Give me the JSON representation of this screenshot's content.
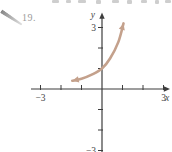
{
  "problem": {
    "number": "19."
  },
  "figure": {
    "background": "#ffffff",
    "axis_color": "#3d3d3d",
    "label_color": "#454545",
    "number_color": "#9b9b9b",
    "pencil_color": "#868686"
  },
  "chart_data": {
    "type": "line",
    "title": "",
    "xlabel": "x",
    "ylabel": "y",
    "xlim": [
      -3,
      3
    ],
    "ylim": [
      -3,
      3
    ],
    "grid": false,
    "legend": false,
    "x_ticks": [
      -3,
      -2,
      -1,
      1,
      2,
      3
    ],
    "y_ticks": [
      -3,
      -2,
      -1,
      1,
      2,
      3
    ],
    "x_tick_labels": [
      {
        "value": -3,
        "label": "−3"
      },
      {
        "value": 3,
        "label": "3"
      }
    ],
    "y_tick_labels": [
      {
        "value": 3,
        "label": "3"
      },
      {
        "value": -3,
        "label": "−3"
      }
    ],
    "series": [
      {
        "name": "exponential-curve",
        "color": "#c4a18c",
        "arrow_ends": "both",
        "points": [
          [
            -1.45,
            0.4
          ],
          [
            -1.0,
            0.5
          ],
          [
            -0.5,
            0.7
          ],
          [
            0,
            1.0
          ],
          [
            0.4,
            1.5
          ],
          [
            0.8,
            2.3
          ],
          [
            1.05,
            3.2
          ]
        ]
      }
    ]
  }
}
